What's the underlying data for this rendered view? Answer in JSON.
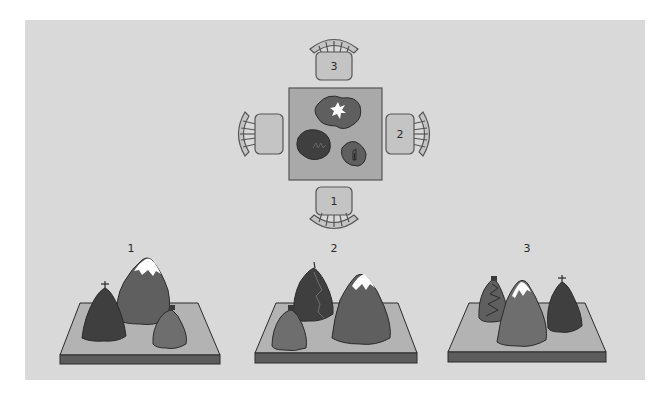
{
  "colors": {
    "page_bg": "#ffffff",
    "panel_bg": "#d9d9d9",
    "table_top": "#a9a9a9",
    "table_border": "#555555",
    "chair_fill": "#c4c4c4",
    "chair_stroke": "#555555",
    "board_top": "#b3b3b3",
    "board_front": "#5c5c5c",
    "mountain_dark": "#3f3f3f",
    "mountain_mid": "#5f5f5f",
    "mountain_light": "#6e6e6e",
    "snow": "#ffffff",
    "outline": "#2b2b2b"
  },
  "top_view": {
    "title": "Top view of table with three mountains",
    "chairs": [
      {
        "position": "bottom",
        "label": "1"
      },
      {
        "position": "right",
        "label": "2"
      },
      {
        "position": "top",
        "label": "3"
      },
      {
        "position": "left",
        "label": ""
      }
    ],
    "mountains": [
      {
        "name": "snow-capped mountain",
        "marker": "snow-star"
      },
      {
        "name": "mountain with zigzag path",
        "marker": "zigzag-path"
      },
      {
        "name": "mountain with hut",
        "marker": "hut"
      }
    ]
  },
  "views": [
    {
      "label": "1",
      "description": "View from chair 1"
    },
    {
      "label": "2",
      "description": "View from chair 2"
    },
    {
      "label": "3",
      "description": "View from chair 3"
    }
  ]
}
